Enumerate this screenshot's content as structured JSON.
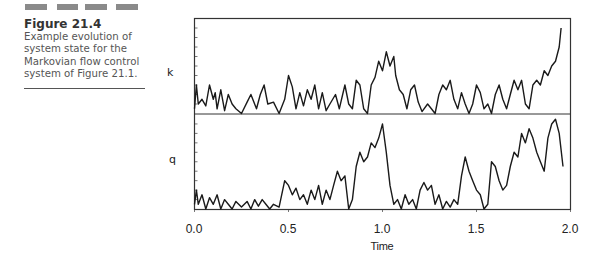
{
  "figure": {
    "number": "Figure 21.4",
    "caption_lines": [
      "Example evolution of",
      "system state for the",
      "Markovian flow control",
      "system of Figure 21.1."
    ]
  },
  "colors": {
    "trace": "#1a1a1a",
    "axis": "#333333",
    "decoration": "#8a8a8a"
  },
  "chart_data": {
    "type": "line",
    "title": "",
    "xlabel": "Time",
    "xlim": [
      0.0,
      2.0
    ],
    "xticks": [
      "0.0",
      "0.5",
      "1.0",
      "1.5",
      "2.0"
    ],
    "grid": false,
    "legend": null,
    "panels": [
      {
        "name": "k",
        "ylabel": "k",
        "y_units": "fraction of panel height (unlabeled axis)",
        "series": [
          [
            0.0,
            0.05
          ],
          [
            0.01,
            0.3
          ],
          [
            0.02,
            0.1
          ],
          [
            0.04,
            0.15
          ],
          [
            0.06,
            0.08
          ],
          [
            0.08,
            0.3
          ],
          [
            0.1,
            0.15
          ],
          [
            0.11,
            0.22
          ],
          [
            0.12,
            0.05
          ],
          [
            0.14,
            0.25
          ],
          [
            0.16,
            0.03
          ],
          [
            0.18,
            0.2
          ],
          [
            0.2,
            0.1
          ],
          [
            0.22,
            0.05
          ],
          [
            0.25,
            0.0
          ],
          [
            0.28,
            0.12
          ],
          [
            0.3,
            0.2
          ],
          [
            0.33,
            0.05
          ],
          [
            0.35,
            0.2
          ],
          [
            0.37,
            0.3
          ],
          [
            0.39,
            0.1
          ],
          [
            0.42,
            0.12
          ],
          [
            0.45,
            0.0
          ],
          [
            0.48,
            0.15
          ],
          [
            0.5,
            0.4
          ],
          [
            0.52,
            0.28
          ],
          [
            0.54,
            0.05
          ],
          [
            0.56,
            0.22
          ],
          [
            0.58,
            0.08
          ],
          [
            0.6,
            0.25
          ],
          [
            0.62,
            0.15
          ],
          [
            0.64,
            0.3
          ],
          [
            0.66,
            0.05
          ],
          [
            0.68,
            0.22
          ],
          [
            0.7,
            0.03
          ],
          [
            0.72,
            0.1
          ],
          [
            0.75,
            0.2
          ],
          [
            0.77,
            0.05
          ],
          [
            0.8,
            0.3
          ],
          [
            0.82,
            0.1
          ],
          [
            0.84,
            0.05
          ],
          [
            0.86,
            0.35
          ],
          [
            0.88,
            0.3
          ],
          [
            0.9,
            0.05
          ],
          [
            0.92,
            0.0
          ],
          [
            0.94,
            0.3
          ],
          [
            0.96,
            0.38
          ],
          [
            0.98,
            0.55
          ],
          [
            1.0,
            0.45
          ],
          [
            1.02,
            0.65
          ],
          [
            1.04,
            0.5
          ],
          [
            1.06,
            0.6
          ],
          [
            1.07,
            0.4
          ],
          [
            1.09,
            0.25
          ],
          [
            1.11,
            0.2
          ],
          [
            1.13,
            0.05
          ],
          [
            1.15,
            0.25
          ],
          [
            1.17,
            0.3
          ],
          [
            1.19,
            0.12
          ],
          [
            1.21,
            0.02
          ],
          [
            1.24,
            0.1
          ],
          [
            1.26,
            0.05
          ],
          [
            1.28,
            0.0
          ],
          [
            1.3,
            0.2
          ],
          [
            1.32,
            0.3
          ],
          [
            1.34,
            0.25
          ],
          [
            1.36,
            0.35
          ],
          [
            1.38,
            0.15
          ],
          [
            1.4,
            0.05
          ],
          [
            1.42,
            0.22
          ],
          [
            1.44,
            0.1
          ],
          [
            1.46,
            0.0
          ],
          [
            1.48,
            0.1
          ],
          [
            1.5,
            0.3
          ],
          [
            1.52,
            0.22
          ],
          [
            1.54,
            0.05
          ],
          [
            1.56,
            0.1
          ],
          [
            1.58,
            0.0
          ],
          [
            1.6,
            0.2
          ],
          [
            1.62,
            0.3
          ],
          [
            1.64,
            0.15
          ],
          [
            1.66,
            0.05
          ],
          [
            1.68,
            0.2
          ],
          [
            1.7,
            0.35
          ],
          [
            1.72,
            0.25
          ],
          [
            1.74,
            0.35
          ],
          [
            1.76,
            0.1
          ],
          [
            1.78,
            0.05
          ],
          [
            1.8,
            0.3
          ],
          [
            1.82,
            0.35
          ],
          [
            1.84,
            0.3
          ],
          [
            1.86,
            0.45
          ],
          [
            1.88,
            0.4
          ],
          [
            1.9,
            0.5
          ],
          [
            1.92,
            0.55
          ],
          [
            1.94,
            0.7
          ],
          [
            1.95,
            0.9
          ]
        ]
      },
      {
        "name": "q",
        "ylabel": "q",
        "y_units": "fraction of panel height (unlabeled axis)",
        "series": [
          [
            0.0,
            0.05
          ],
          [
            0.01,
            0.2
          ],
          [
            0.02,
            0.05
          ],
          [
            0.04,
            0.15
          ],
          [
            0.06,
            0.0
          ],
          [
            0.08,
            0.12
          ],
          [
            0.1,
            0.05
          ],
          [
            0.12,
            0.15
          ],
          [
            0.14,
            0.0
          ],
          [
            0.16,
            0.1
          ],
          [
            0.18,
            0.05
          ],
          [
            0.2,
            0.0
          ],
          [
            0.22,
            0.08
          ],
          [
            0.25,
            0.02
          ],
          [
            0.28,
            0.08
          ],
          [
            0.3,
            0.0
          ],
          [
            0.32,
            0.1
          ],
          [
            0.34,
            0.03
          ],
          [
            0.36,
            0.1
          ],
          [
            0.38,
            0.05
          ],
          [
            0.4,
            0.0
          ],
          [
            0.42,
            0.05
          ],
          [
            0.45,
            0.02
          ],
          [
            0.48,
            0.3
          ],
          [
            0.5,
            0.25
          ],
          [
            0.52,
            0.15
          ],
          [
            0.54,
            0.22
          ],
          [
            0.56,
            0.1
          ],
          [
            0.58,
            0.15
          ],
          [
            0.6,
            0.05
          ],
          [
            0.62,
            0.2
          ],
          [
            0.64,
            0.1
          ],
          [
            0.66,
            0.25
          ],
          [
            0.68,
            0.05
          ],
          [
            0.7,
            0.2
          ],
          [
            0.72,
            0.1
          ],
          [
            0.74,
            0.25
          ],
          [
            0.76,
            0.4
          ],
          [
            0.78,
            0.3
          ],
          [
            0.8,
            0.35
          ],
          [
            0.82,
            0.0
          ],
          [
            0.84,
            0.1
          ],
          [
            0.86,
            0.45
          ],
          [
            0.88,
            0.6
          ],
          [
            0.9,
            0.5
          ],
          [
            0.92,
            0.55
          ],
          [
            0.94,
            0.7
          ],
          [
            0.96,
            0.65
          ],
          [
            0.98,
            0.75
          ],
          [
            1.0,
            0.9
          ],
          [
            1.02,
            0.6
          ],
          [
            1.04,
            0.25
          ],
          [
            1.06,
            0.05
          ],
          [
            1.08,
            0.1
          ],
          [
            1.1,
            0.0
          ],
          [
            1.12,
            0.15
          ],
          [
            1.14,
            0.05
          ],
          [
            1.16,
            0.1
          ],
          [
            1.18,
            0.0
          ],
          [
            1.2,
            0.2
          ],
          [
            1.22,
            0.28
          ],
          [
            1.24,
            0.2
          ],
          [
            1.26,
            0.25
          ],
          [
            1.28,
            0.05
          ],
          [
            1.3,
            0.15
          ],
          [
            1.32,
            0.0
          ],
          [
            1.34,
            0.08
          ],
          [
            1.36,
            0.02
          ],
          [
            1.38,
            0.1
          ],
          [
            1.4,
            0.05
          ],
          [
            1.42,
            0.35
          ],
          [
            1.44,
            0.55
          ],
          [
            1.46,
            0.4
          ],
          [
            1.48,
            0.3
          ],
          [
            1.5,
            0.2
          ],
          [
            1.52,
            0.15
          ],
          [
            1.54,
            0.0
          ],
          [
            1.56,
            0.05
          ],
          [
            1.58,
            0.5
          ],
          [
            1.6,
            0.45
          ],
          [
            1.62,
            0.3
          ],
          [
            1.64,
            0.2
          ],
          [
            1.66,
            0.25
          ],
          [
            1.68,
            0.45
          ],
          [
            1.7,
            0.6
          ],
          [
            1.72,
            0.55
          ],
          [
            1.74,
            0.8
          ],
          [
            1.76,
            0.7
          ],
          [
            1.78,
            0.85
          ],
          [
            1.8,
            0.75
          ],
          [
            1.82,
            0.6
          ],
          [
            1.84,
            0.5
          ],
          [
            1.86,
            0.4
          ],
          [
            1.88,
            0.75
          ],
          [
            1.9,
            0.9
          ],
          [
            1.92,
            0.95
          ],
          [
            1.94,
            0.8
          ],
          [
            1.96,
            0.45
          ]
        ]
      }
    ]
  }
}
